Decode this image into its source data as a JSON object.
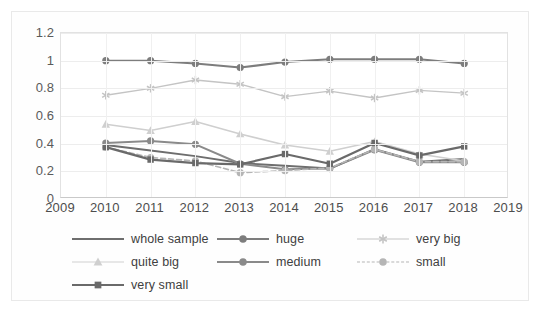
{
  "chart_data": {
    "type": "line",
    "title": "",
    "xlabel": "",
    "ylabel": "",
    "x": [
      2010,
      2011,
      2012,
      2013,
      2014,
      2015,
      2016,
      2017,
      2018
    ],
    "xticks": [
      "2009",
      "2010",
      "2011",
      "2012",
      "2013",
      "2014",
      "2015",
      "2016",
      "2017",
      "2018",
      "2019"
    ],
    "yticks": [
      "0",
      "0.2",
      "0.4",
      "0.6",
      "0.8",
      "1",
      "1.2"
    ],
    "ylim": [
      0,
      1.2
    ],
    "xlim": [
      2009,
      2019
    ],
    "grid": true,
    "legend_position": "bottom",
    "series": [
      {
        "name": "whole sample",
        "values": [
          0.39,
          0.35,
          0.31,
          0.26,
          0.24,
          0.22,
          0.36,
          0.27,
          0.29
        ],
        "color": "#6e6e6e",
        "marker": "none",
        "dash": "solid",
        "width": 2.0
      },
      {
        "name": "huge",
        "values": [
          1.0,
          1.0,
          0.98,
          0.95,
          0.99,
          1.01,
          1.01,
          1.01,
          0.98
        ],
        "color": "#7d7d7d",
        "marker": "circle",
        "dash": "solid",
        "width": 2.0
      },
      {
        "name": "very big",
        "values": [
          0.75,
          0.8,
          0.86,
          0.83,
          0.74,
          0.78,
          0.73,
          0.785,
          0.765
        ],
        "color": "#c4c4c4",
        "marker": "asterisk",
        "dash": "solid",
        "width": 1.4
      },
      {
        "name": "quite big",
        "values": [
          0.54,
          0.495,
          0.56,
          0.47,
          0.39,
          0.345,
          0.415,
          0.325,
          0.275
        ],
        "color": "#cfcfcf",
        "marker": "triangle",
        "dash": "solid",
        "width": 1.6
      },
      {
        "name": "medium",
        "values": [
          0.405,
          0.42,
          0.395,
          0.255,
          0.215,
          0.22,
          0.355,
          0.265,
          0.265
        ],
        "color": "#8a8a8a",
        "marker": "circle",
        "dash": "solid",
        "width": 2.0
      },
      {
        "name": "small",
        "values": [
          0.375,
          0.3,
          0.275,
          0.19,
          0.205,
          0.225,
          0.36,
          0.27,
          0.27
        ],
        "color": "#b5b5b5",
        "marker": "circle",
        "dash": "dashed",
        "width": 1.6
      },
      {
        "name": "very small",
        "values": [
          0.375,
          0.285,
          0.26,
          0.25,
          0.325,
          0.255,
          0.405,
          0.315,
          0.38
        ],
        "color": "#6a6a6a",
        "marker": "square",
        "dash": "solid",
        "width": 2.2
      }
    ]
  },
  "legend": {
    "rows": [
      [
        "whole sample",
        "huge",
        "very big"
      ],
      [
        "quite big",
        "medium",
        "small"
      ],
      [
        "very small"
      ]
    ]
  }
}
